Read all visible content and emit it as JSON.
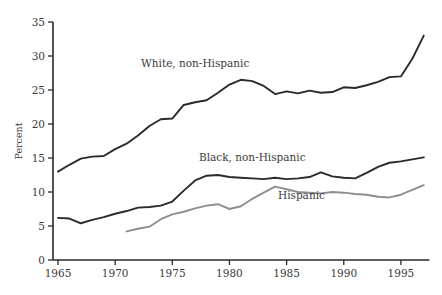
{
  "chart_data": {
    "type": "line",
    "title": "",
    "subtitle": "",
    "xlabel": "",
    "ylabel": "Percent",
    "xlim": [
      1964,
      1997.5
    ],
    "ylim": [
      0,
      35
    ],
    "grid": false,
    "legend_position": "inline-annotations",
    "x_ticks": [
      1965,
      1970,
      1975,
      1980,
      1985,
      1990,
      1995
    ],
    "x_tick_labels": [
      "1965",
      "1970",
      "1975",
      "1980",
      "1985",
      "1990",
      "1995"
    ],
    "y_ticks": [
      0,
      5,
      10,
      15,
      20,
      25,
      30,
      35
    ],
    "y_tick_labels": [
      "0",
      "5",
      "10",
      "15",
      "20",
      "25",
      "30",
      "35"
    ],
    "series": [
      {
        "name": "White, non-Hispanic",
        "color": "#2a2a2a",
        "width": 1.9,
        "label_x": 1977.0,
        "label_y": 28.4,
        "x": [
          1965,
          1966,
          1967,
          1968,
          1969,
          1970,
          1971,
          1972,
          1973,
          1974,
          1975,
          1976,
          1977,
          1978,
          1979,
          1980,
          1981,
          1982,
          1983,
          1984,
          1985,
          1986,
          1987,
          1988,
          1989,
          1990,
          1991,
          1992,
          1993,
          1994,
          1995,
          1996,
          1997
        ],
        "y": [
          13.0,
          14.0,
          14.9,
          15.2,
          15.3,
          16.3,
          17.1,
          18.3,
          19.7,
          20.7,
          20.8,
          22.8,
          23.2,
          23.5,
          24.6,
          25.8,
          26.5,
          26.3,
          25.6,
          24.4,
          24.8,
          24.5,
          24.9,
          24.6,
          24.7,
          25.4,
          25.3,
          25.7,
          26.2,
          26.9,
          27.0,
          29.6,
          33.0
        ]
      },
      {
        "name": "Black, non-Hispanic",
        "color": "#2a2a2a",
        "width": 1.9,
        "label_x": 1982.0,
        "label_y": 14.6,
        "x": [
          1965,
          1966,
          1967,
          1968,
          1969,
          1970,
          1971,
          1972,
          1973,
          1974,
          1975,
          1976,
          1977,
          1978,
          1979,
          1980,
          1981,
          1982,
          1983,
          1984,
          1985,
          1986,
          1987,
          1988,
          1989,
          1990,
          1991,
          1992,
          1993,
          1994,
          1995,
          1996,
          1997
        ],
        "y": [
          6.2,
          6.1,
          5.4,
          5.9,
          6.3,
          6.8,
          7.2,
          7.7,
          7.8,
          8.0,
          8.6,
          10.2,
          11.7,
          12.4,
          12.5,
          12.2,
          12.1,
          12.0,
          11.9,
          12.1,
          11.9,
          12.0,
          12.2,
          12.9,
          12.3,
          12.1,
          12.0,
          12.8,
          13.7,
          14.3,
          14.5,
          14.8,
          15.1
        ]
      },
      {
        "name": "Hispanic",
        "color": "#8e8e8e",
        "width": 1.9,
        "label_x": 1986.3,
        "label_y": 9.0,
        "x": [
          1971,
          1972,
          1973,
          1974,
          1975,
          1976,
          1977,
          1978,
          1979,
          1980,
          1981,
          1982,
          1983,
          1984,
          1985,
          1986,
          1987,
          1988,
          1989,
          1990,
          1991,
          1992,
          1993,
          1994,
          1995,
          1996,
          1997
        ],
        "y": [
          4.2,
          4.6,
          4.9,
          6.0,
          6.7,
          7.1,
          7.6,
          8.0,
          8.2,
          7.5,
          7.9,
          9.0,
          9.9,
          10.8,
          10.4,
          10.0,
          9.9,
          9.8,
          10.0,
          9.9,
          9.7,
          9.6,
          9.3,
          9.2,
          9.6,
          10.3,
          11.0
        ]
      }
    ]
  },
  "axis": {
    "y_title": "Percent"
  }
}
